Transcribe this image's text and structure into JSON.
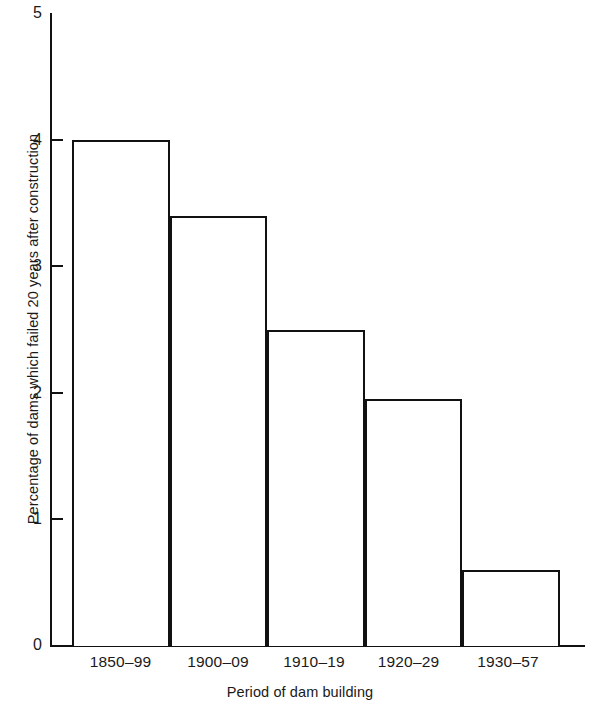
{
  "chart_data": {
    "type": "bar",
    "title": "",
    "subtitle": "",
    "categories": [
      "1850–99",
      "1900–09",
      "1910–19",
      "1920–29",
      "1930–57"
    ],
    "values": [
      4.0,
      3.4,
      2.5,
      1.95,
      0.6
    ],
    "xlabel": "Period of dam building",
    "ylabel": "Percentage of dams which failed 20 years after construction",
    "ylim": [
      0,
      5
    ],
    "yticks": [
      "5",
      "4",
      "3",
      "2",
      "1",
      "0"
    ],
    "ytick_values": [
      5,
      4,
      3,
      2,
      1,
      0
    ],
    "grid": false,
    "legend": false,
    "legend_position": "none",
    "bar_fill": "#ffffff",
    "bar_edge": "#111111",
    "background": "#ffffff"
  },
  "figure": {
    "axis_color": "#111111",
    "text_color": "#1a1a1a"
  }
}
